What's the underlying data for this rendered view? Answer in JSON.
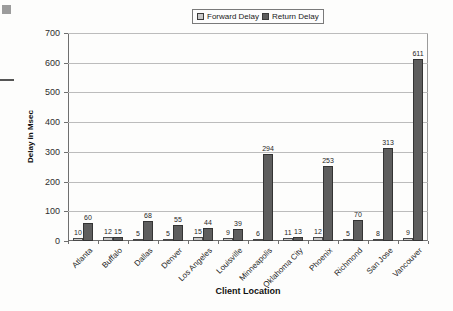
{
  "chart_data": {
    "type": "bar",
    "title": "",
    "xlabel": "Client Location",
    "ylabel": "Delay in Msec",
    "ylim": [
      0,
      700
    ],
    "ytick_step": 100,
    "grid": true,
    "legend_position": "top-center",
    "categories": [
      "Atlanta",
      "Buffalo",
      "Dallas",
      "Denver",
      "Los Angeles",
      "Louisville",
      "Minneapolis",
      "Oklahoma City",
      "Phoenix",
      "Richmond",
      "San Jose",
      "Vancouver"
    ],
    "series": [
      {
        "name": "Forward Delay",
        "color": "#c9c9c9",
        "border_color": "#4a4a4a",
        "values": [
          10,
          12,
          5,
          5,
          15,
          9,
          6,
          11,
          12,
          5,
          8,
          9
        ]
      },
      {
        "name": "Return Delay",
        "color": "#5e5e5e",
        "border_color": "#343434",
        "values": [
          60,
          15,
          68,
          55,
          44,
          39,
          294,
          13,
          253,
          70,
          313,
          611
        ]
      }
    ]
  },
  "legend": {
    "forward_label": "Forward Delay",
    "return_label": "Return Delay"
  },
  "axes": {
    "y_title": "Delay in Msec",
    "x_title": "Client Location",
    "y_ticks": [
      0,
      100,
      200,
      300,
      400,
      500,
      600,
      700
    ]
  }
}
